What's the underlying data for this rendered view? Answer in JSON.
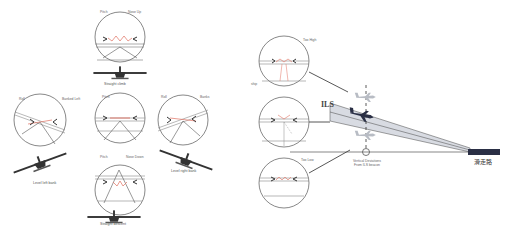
{
  "left_panel": {
    "title": "Attitude indicator views",
    "views": [
      {
        "id": "top",
        "left_label": "Pitch",
        "right_label": "Nose Up",
        "caption": "Straight climb"
      },
      {
        "id": "left",
        "left_label": "Roll",
        "right_label": "Banked Left",
        "caption": "Level left bank"
      },
      {
        "id": "center",
        "left_label": "Pitch",
        "right_label": "",
        "caption": ""
      },
      {
        "id": "right",
        "left_label": "Roll",
        "right_label": "Banks",
        "caption": "Level right bank"
      },
      {
        "id": "bottom",
        "left_label": "Pitch",
        "right_label": "Nose Down",
        "caption": "Straight descent"
      }
    ]
  },
  "right_panel": {
    "title": "ILS glide slope",
    "views": [
      {
        "id": "too-high",
        "label": "Too High"
      },
      {
        "id": "on-path",
        "label": "ship"
      },
      {
        "id": "too-low",
        "label": "Too Low"
      }
    ],
    "ils_label": "ILS",
    "beacon_caption_line1": "Vertical Deviations",
    "beacon_caption_line2": "From ILS beacon",
    "runway_label": "滑走路"
  },
  "colors": {
    "stroke": "#555555",
    "accent_red": "#e07060",
    "plane_dark": "#2a2f45",
    "plane_light": "#b8bcc4",
    "beam": "#d8dbe2",
    "runway": "#2a2f45"
  }
}
